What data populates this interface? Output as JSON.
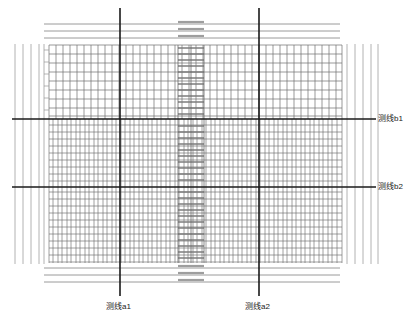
{
  "figure": {
    "kind": "engineering-survey-grid-plan",
    "width": 416,
    "height": 324,
    "background_color": "#ffffff"
  },
  "labels": {
    "survey_line_a1": "测线a1",
    "survey_line_a2": "测线a2",
    "survey_line_b1": "测线b1",
    "survey_line_b2": "测线b2"
  },
  "colors": {
    "survey_line": "#1a1a1a",
    "grid_major": "#4a4a4a",
    "grid_minor": "#8c8c8c",
    "grid_faint": "#b5b5b5",
    "outer_line": "#9a9a9a",
    "center_band": "#7a7a7a",
    "text": "#1a1a1a"
  },
  "survey_lines": {
    "vertical": [
      {
        "name": "测线a1",
        "x": 120,
        "y1": 8,
        "y2": 296,
        "width": 1.6
      },
      {
        "name": "测线a2",
        "x": 259,
        "y1": 8,
        "y2": 296,
        "width": 1.6
      }
    ],
    "horizontal": [
      {
        "name": "测线b1",
        "y": 119,
        "x1": 12,
        "x2": 376,
        "width": 1.6
      },
      {
        "name": "测线b2",
        "y": 187,
        "x1": 12,
        "x2": 376,
        "width": 1.6
      }
    ]
  },
  "grid": {
    "main_area": {
      "x1": 49,
      "y1": 45,
      "x2": 342,
      "y2": 263
    },
    "upper_band": {
      "y1": 45,
      "y2": 119,
      "column_pitch": 7.0,
      "row_pitch": 9.2
    },
    "middle_band": {
      "y1": 119,
      "y2": 187,
      "column_pitch": 4.6,
      "row_pitch": 6.4
    },
    "lower_band": {
      "y1": 187,
      "y2": 263,
      "column_pitch": 4.6,
      "row_pitch": 6.4
    },
    "left_outer_columns": {
      "x1": 14,
      "x2": 44,
      "count": 5
    },
    "right_outer_columns": {
      "x1": 347,
      "x2": 378,
      "count": 5
    },
    "center_dense_band": {
      "x1": 178,
      "x2": 204,
      "row_pitch": 5.2
    },
    "top_rule_lines": {
      "y_values": [
        24,
        31,
        38
      ],
      "x1": 44,
      "x2": 340
    },
    "bottom_rule_lines": {
      "y_values": [
        268,
        275,
        282
      ],
      "x1": 44,
      "x2": 340
    }
  },
  "annotations": {
    "dash_prefix": "—"
  }
}
